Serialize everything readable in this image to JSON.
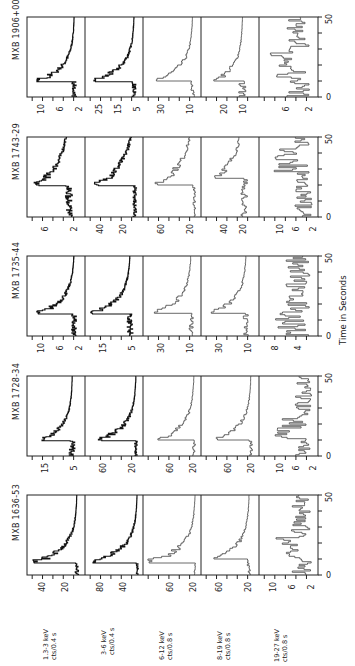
{
  "figure": {
    "x_axis_title": "Time in Seconds",
    "time_ticks": [
      "0",
      "50"
    ],
    "bands": [
      {
        "energy": "1.3-3 keV",
        "units": "cts/0.4 s"
      },
      {
        "energy": "3-6 keV",
        "units": "cts/0.4 s"
      },
      {
        "energy": "6-12 keV",
        "units": "cts/0.8 s"
      },
      {
        "energy": "8-19 keV",
        "units": "cts/0.8 s"
      },
      {
        "energy": "19-27 keV",
        "units": "cts/0.8 s"
      }
    ],
    "sources": [
      {
        "name": "MXB 1906+00"
      },
      {
        "name": "MXB 1743-29"
      },
      {
        "name": "MXB 1735-44"
      },
      {
        "name": "MXB 1728-34"
      },
      {
        "name": "MXB 1636-53"
      }
    ]
  },
  "chart_data": {
    "type": "line",
    "xlabel": "Time in Seconds",
    "xlim": [
      0,
      50
    ],
    "layout": "figure rotated 90 degrees counter-clockwise; rows = sources, columns = energy bands",
    "panels": [
      {
        "source": "MXB 1906+00",
        "band": "1.3-3 keV",
        "ylabel": "cts/0.4 s",
        "yticks": [
          2,
          6,
          10
        ],
        "ylim": [
          0,
          12
        ],
        "peak_time": 10,
        "peak": 10,
        "background": 2
      },
      {
        "source": "MXB 1906+00",
        "band": "3-6 keV",
        "ylabel": "cts/0.4 s",
        "yticks": [
          5,
          15,
          25
        ],
        "ylim": [
          0,
          30
        ],
        "peak_time": 10,
        "peak": 26,
        "background": 4
      },
      {
        "source": "MXB 1906+00",
        "band": "6-12 keV",
        "ylabel": "cts/0.8 s",
        "yticks": [
          10,
          30
        ],
        "ylim": [
          0,
          40
        ],
        "peak_time": 10,
        "peak": 32,
        "background": 5
      },
      {
        "source": "MXB 1906+00",
        "band": "8-19 keV",
        "ylabel": "cts/0.8 s",
        "yticks": [
          10,
          20
        ],
        "ylim": [
          0,
          30
        ],
        "peak_time": 10,
        "peak": 24,
        "background": 8
      },
      {
        "source": "MXB 1906+00",
        "band": "19-27 keV",
        "ylabel": "cts/0.8 s",
        "yticks": [
          2,
          6
        ],
        "ylim": [
          0,
          10
        ],
        "peak_time": 12,
        "peak": 8,
        "background": 3
      },
      {
        "source": "MXB 1743-29",
        "band": "1.3-3 keV",
        "ylabel": "cts/0.4 s",
        "yticks": [
          2,
          6
        ],
        "ylim": [
          0,
          8
        ],
        "peak_time": 20,
        "peak": 7,
        "background": 2
      },
      {
        "source": "MXB 1743-29",
        "band": "3-6 keV",
        "ylabel": "cts/0.4 s",
        "yticks": [
          20,
          40
        ],
        "ylim": [
          0,
          50
        ],
        "peak_time": 20,
        "peak": 42,
        "background": 6
      },
      {
        "source": "MXB 1743-29",
        "band": "6-12 keV",
        "ylabel": "cts/0.8 s",
        "yticks": [
          20,
          60
        ],
        "ylim": [
          0,
          80
        ],
        "peak_time": 20,
        "peak": 65,
        "background": 8
      },
      {
        "source": "MXB 1743-29",
        "band": "8-19 keV",
        "ylabel": "cts/0.8 s",
        "yticks": [
          20,
          40
        ],
        "ylim": [
          0,
          60
        ],
        "peak_time": 24,
        "peak": 48,
        "background": 14
      },
      {
        "source": "MXB 1743-29",
        "band": "19-27 keV",
        "ylabel": "cts/0.8 s",
        "yticks": [
          2,
          6,
          10
        ],
        "ylim": [
          0,
          14
        ],
        "peak_time": 28,
        "peak": 12,
        "background": 3
      },
      {
        "source": "MXB 1735-44",
        "band": "1.3-3 keV",
        "ylabel": "cts/0.4 s",
        "yticks": [
          2,
          6,
          10
        ],
        "ylim": [
          0,
          12
        ],
        "peak_time": 14,
        "peak": 10,
        "background": 2
      },
      {
        "source": "MXB 1735-44",
        "band": "3-6 keV",
        "ylabel": "cts/0.4 s",
        "yticks": [
          5,
          15
        ],
        "ylim": [
          0,
          20
        ],
        "peak_time": 14,
        "peak": 18,
        "background": 4
      },
      {
        "source": "MXB 1735-44",
        "band": "6-12 keV",
        "ylabel": "cts/0.8 s",
        "yticks": [
          10,
          30
        ],
        "ylim": [
          0,
          40
        ],
        "peak_time": 14,
        "peak": 33,
        "background": 6
      },
      {
        "source": "MXB 1735-44",
        "band": "8-19 keV",
        "ylabel": "cts/0.8 s",
        "yticks": [
          10,
          30
        ],
        "ylim": [
          0,
          40
        ],
        "peak_time": 14,
        "peak": 34,
        "background": 8
      },
      {
        "source": "MXB 1735-44",
        "band": "19-27 keV",
        "ylabel": "cts/0.8 s",
        "yticks": [
          4,
          8
        ],
        "ylim": [
          0,
          10
        ],
        "peak_time": 0,
        "peak": 8,
        "background": 3
      },
      {
        "source": "MXB 1728-34",
        "band": "1.3-3 keV",
        "ylabel": "cts/0.4 s",
        "yticks": [
          5,
          15
        ],
        "ylim": [
          0,
          20
        ],
        "peak_time": 10,
        "peak": 15,
        "background": 4
      },
      {
        "source": "MXB 1728-34",
        "band": "3-6 keV",
        "ylabel": "cts/0.4 s",
        "yticks": [
          20,
          60
        ],
        "ylim": [
          0,
          80
        ],
        "peak_time": 10,
        "peak": 62,
        "background": 8
      },
      {
        "source": "MXB 1728-34",
        "band": "6-12 keV",
        "ylabel": "cts/0.8 s",
        "yticks": [
          20,
          60
        ],
        "ylim": [
          0,
          100
        ],
        "peak_time": 10,
        "peak": 78,
        "background": 10
      },
      {
        "source": "MXB 1728-34",
        "band": "8-19 keV",
        "ylabel": "cts/0.8 s",
        "yticks": [
          20,
          60
        ],
        "ylim": [
          0,
          100
        ],
        "peak_time": 10,
        "peak": 75,
        "background": 12
      },
      {
        "source": "MXB 1728-34",
        "band": "19-27 keV",
        "ylabel": "cts/0.8 s",
        "yticks": [
          2,
          6,
          10
        ],
        "ylim": [
          0,
          14
        ],
        "peak_time": 10,
        "peak": 11,
        "background": 3
      },
      {
        "source": "MXB 1636-53",
        "band": "1.3-3 keV",
        "ylabel": "cts/0.4 s",
        "yticks": [
          20,
          40
        ],
        "ylim": [
          0,
          50
        ],
        "peak_time": 8,
        "peak": 45,
        "background": 6
      },
      {
        "source": "MXB 1636-53",
        "band": "3-6 keV",
        "ylabel": "cts/0.4 s",
        "yticks": [
          40,
          80
        ],
        "ylim": [
          0,
          100
        ],
        "peak_time": 8,
        "peak": 90,
        "background": 8
      },
      {
        "source": "MXB 1636-53",
        "band": "6-12 keV",
        "ylabel": "cts/0.8 s",
        "yticks": [
          20,
          60
        ],
        "ylim": [
          0,
          100
        ],
        "peak_time": 8,
        "peak": 92,
        "background": 8
      },
      {
        "source": "MXB 1636-53",
        "band": "8-19 keV",
        "ylabel": "cts/0.8 s",
        "yticks": [
          20,
          60
        ],
        "ylim": [
          0,
          80
        ],
        "peak_time": 10,
        "peak": 62,
        "background": 12
      },
      {
        "source": "MXB 1636-53",
        "band": "19-27 keV",
        "ylabel": "cts/0.8 s",
        "yticks": [
          2,
          6,
          10
        ],
        "ylim": [
          0,
          12
        ],
        "peak_time": 10,
        "peak": 9,
        "background": 3
      }
    ]
  }
}
